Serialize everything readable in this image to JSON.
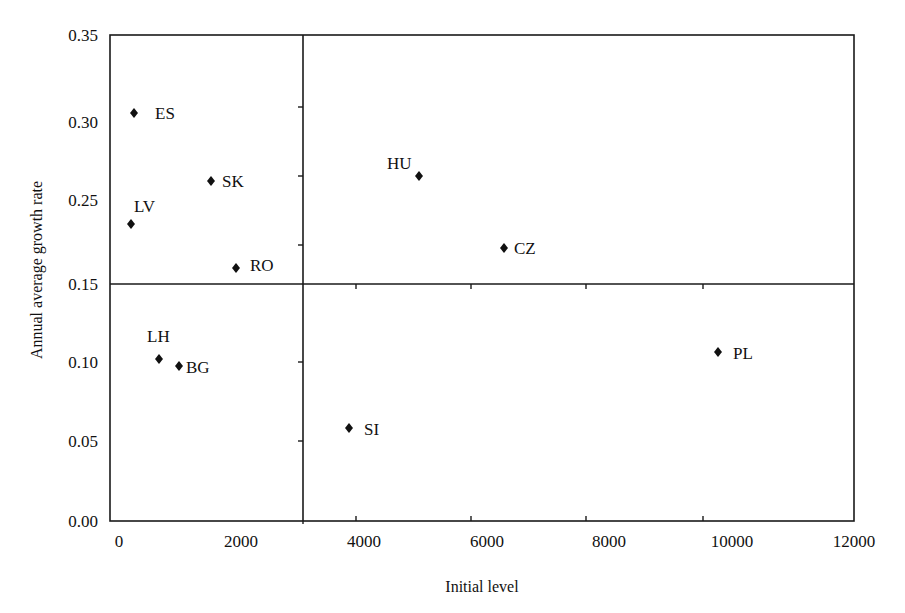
{
  "chart_data": {
    "type": "scatter",
    "title": "",
    "xlabel": "Initial level",
    "ylabel": "Annual average growth rate",
    "xlim": [
      0,
      12000
    ],
    "ylim": [
      0.0,
      0.35
    ],
    "grid": false,
    "legend": null,
    "x_ticks": [
      "0",
      "2000",
      "4000",
      "6000",
      "8000",
      "10000",
      "12000"
    ],
    "y_ticks": [
      "0.00",
      "0.05",
      "0.10",
      "0.15",
      "0.25",
      "0.30",
      "0.35"
    ],
    "quadrant_dividers": {
      "x": 3000,
      "y": 0.15
    },
    "points": [
      {
        "label": "ES",
        "x": 250,
        "y": 0.305
      },
      {
        "label": "SK",
        "x": 1500,
        "y": 0.262
      },
      {
        "label": "LV",
        "x": 200,
        "y": 0.221
      },
      {
        "label": "RO",
        "x": 1900,
        "y": 0.169
      },
      {
        "label": "HU",
        "x": 4900,
        "y": 0.265
      },
      {
        "label": "CZ",
        "x": 6300,
        "y": 0.193
      },
      {
        "label": "LH",
        "x": 650,
        "y": 0.102
      },
      {
        "label": "BG",
        "x": 1000,
        "y": 0.097
      },
      {
        "label": "SI",
        "x": 3750,
        "y": 0.058
      },
      {
        "label": "PL",
        "x": 9800,
        "y": 0.106
      }
    ]
  },
  "layout": {
    "plot": {
      "left": 110,
      "top": 35,
      "right": 854,
      "bottom": 521,
      "divider_x": 303,
      "divider_y": 284
    },
    "x_label_positions": [
      119,
      241,
      364,
      487,
      609,
      732,
      854
    ],
    "y_label_positions": [
      521,
      441,
      362,
      284,
      200,
      122,
      35
    ],
    "inner_ticks_x": [
      356,
      471,
      586,
      703
    ],
    "inner_ticks_y_upper": [
      107,
      176,
      245
    ],
    "inner_ticks_y_lower": [
      362,
      441
    ],
    "points_px": [
      {
        "x": 134,
        "y": 113,
        "lx": 155,
        "ly": 113,
        "anchor": "start"
      },
      {
        "x": 211,
        "y": 181,
        "lx": 222,
        "ly": 181,
        "anchor": "start"
      },
      {
        "x": 131,
        "y": 224,
        "lx": 134,
        "ly": 206,
        "anchor": "start"
      },
      {
        "x": 236,
        "y": 268,
        "lx": 250,
        "ly": 265,
        "anchor": "start"
      },
      {
        "x": 419,
        "y": 176,
        "lx": 387,
        "ly": 163,
        "anchor": "start"
      },
      {
        "x": 504,
        "y": 248,
        "lx": 514,
        "ly": 248,
        "anchor": "start"
      },
      {
        "x": 159,
        "y": 359,
        "lx": 147,
        "ly": 336,
        "anchor": "start"
      },
      {
        "x": 179,
        "y": 366,
        "lx": 186,
        "ly": 367,
        "anchor": "start"
      },
      {
        "x": 349,
        "y": 428,
        "lx": 364,
        "ly": 429,
        "anchor": "start"
      },
      {
        "x": 718,
        "y": 352,
        "lx": 733,
        "ly": 353,
        "anchor": "start"
      }
    ]
  }
}
